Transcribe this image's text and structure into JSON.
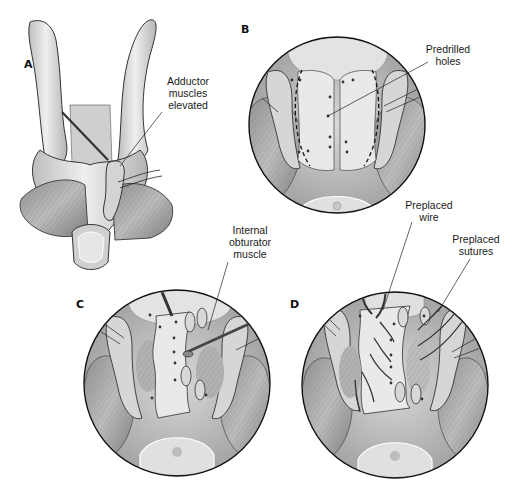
{
  "figure": {
    "panels": [
      {
        "id": "A",
        "letter": "A",
        "callouts": [
          {
            "lines": [
              "Adductor",
              "muscles",
              "elevated"
            ]
          }
        ]
      },
      {
        "id": "B",
        "letter": "B",
        "callouts": [
          {
            "lines": [
              "Predrilled",
              "holes"
            ]
          }
        ]
      },
      {
        "id": "C",
        "letter": "C",
        "callouts": [
          {
            "lines": [
              "Internal",
              "obturator",
              "muscle"
            ]
          }
        ]
      },
      {
        "id": "D",
        "letter": "D",
        "callouts": [
          {
            "lines": [
              "Preplaced",
              "wire"
            ]
          },
          {
            "lines": [
              "Preplaced",
              "sutures"
            ]
          }
        ]
      }
    ],
    "colors": {
      "background": "#ffffff",
      "bone_light": "#e6e6e6",
      "bone_mid": "#c8c8c8",
      "muscle": "#a9a9a9",
      "muscle_dark": "#8a8a8a",
      "outline": "#1a1a1a",
      "dashed_cut": "#111111"
    }
  }
}
